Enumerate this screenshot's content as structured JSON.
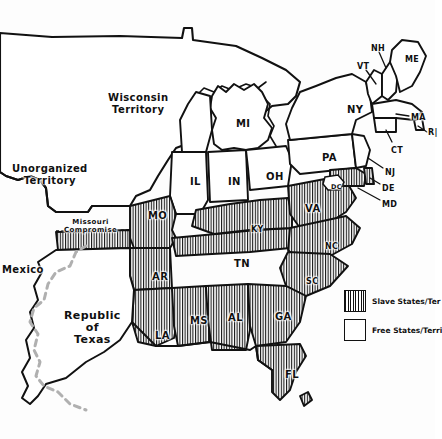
{
  "map": {
    "title": "United States c.1840 - Slave and Free States Map",
    "style": "hand-drawn ink sketch",
    "background_color": "#fdfdfd",
    "ink_color": "#111111",
    "hatch_color": "#111111",
    "mexico_border_color": "#b0b0b0"
  },
  "territories": [
    {
      "name": "wisconsin-territory",
      "line1": "Wisconsin",
      "line2": "Territory",
      "x": 108,
      "y": 92,
      "status": "free"
    },
    {
      "name": "unorganized-territory",
      "line1": "Unorganized",
      "line2": "Territory",
      "x": 12,
      "y": 163,
      "status": "free"
    },
    {
      "name": "mexico",
      "line1": "Mexico",
      "line2": "",
      "x": 2,
      "y": 264,
      "status": "foreign"
    },
    {
      "name": "republic-of-texas",
      "line1": "Republic",
      "line2": "of",
      "line3": "Texas",
      "x": 64,
      "y": 310,
      "status": "foreign"
    }
  ],
  "annotations": {
    "missouri_compromise": {
      "line1": "Missouri",
      "line2": "Compromise",
      "x": 64,
      "y": 219
    }
  },
  "states": [
    {
      "abbr": "MI",
      "x": 236,
      "y": 118,
      "status": "free",
      "size": "st"
    },
    {
      "abbr": "IL",
      "x": 190,
      "y": 176,
      "status": "free",
      "size": "st"
    },
    {
      "abbr": "IN",
      "x": 228,
      "y": 176,
      "status": "free",
      "size": "st"
    },
    {
      "abbr": "OH",
      "x": 266,
      "y": 171,
      "status": "free",
      "size": "st"
    },
    {
      "abbr": "PA",
      "x": 322,
      "y": 152,
      "status": "free",
      "size": "st"
    },
    {
      "abbr": "NY",
      "x": 347,
      "y": 104,
      "status": "free",
      "size": "st"
    },
    {
      "abbr": "VT",
      "x": 357,
      "y": 62,
      "status": "free",
      "size": "st-sm"
    },
    {
      "abbr": "NH",
      "x": 371,
      "y": 44,
      "status": "free",
      "size": "st-sm"
    },
    {
      "abbr": "ME",
      "x": 405,
      "y": 55,
      "status": "free",
      "size": "st-sm"
    },
    {
      "abbr": "MA",
      "x": 411,
      "y": 113,
      "status": "free",
      "size": "st-sm"
    },
    {
      "abbr": "R|",
      "x": 428,
      "y": 128,
      "status": "free",
      "size": "st-sm"
    },
    {
      "abbr": "CT",
      "x": 391,
      "y": 146,
      "status": "free",
      "size": "st-sm"
    },
    {
      "abbr": "NJ",
      "x": 385,
      "y": 168,
      "status": "free",
      "size": "st-sm"
    },
    {
      "abbr": "DE",
      "x": 382,
      "y": 184,
      "status": "slave",
      "size": "st-sm"
    },
    {
      "abbr": "MD",
      "x": 382,
      "y": 200,
      "status": "slave",
      "size": "st-sm"
    },
    {
      "abbr": "VA",
      "x": 305,
      "y": 203,
      "status": "slave",
      "size": "st"
    },
    {
      "abbr": "DC",
      "x": 331,
      "y": 183,
      "status": "slave",
      "size": "st-xs"
    },
    {
      "abbr": "NC",
      "x": 325,
      "y": 242,
      "status": "slave",
      "size": "st-sm"
    },
    {
      "abbr": "SC",
      "x": 306,
      "y": 277,
      "status": "slave",
      "size": "st-sm"
    },
    {
      "abbr": "GA",
      "x": 275,
      "y": 311,
      "status": "slave",
      "size": "st"
    },
    {
      "abbr": "FL",
      "x": 285,
      "y": 369,
      "status": "slave",
      "size": "st"
    },
    {
      "abbr": "AL",
      "x": 228,
      "y": 312,
      "status": "slave",
      "size": "st"
    },
    {
      "abbr": "MS",
      "x": 190,
      "y": 315,
      "status": "slave",
      "size": "st"
    },
    {
      "abbr": "LA",
      "x": 155,
      "y": 330,
      "status": "slave",
      "size": "st"
    },
    {
      "abbr": "AR",
      "x": 152,
      "y": 271,
      "status": "slave",
      "size": "st"
    },
    {
      "abbr": "MO",
      "x": 148,
      "y": 210,
      "status": "slave",
      "size": "st"
    },
    {
      "abbr": "TN",
      "x": 234,
      "y": 258,
      "status": "slave",
      "size": "st"
    },
    {
      "abbr": "KY",
      "x": 251,
      "y": 225,
      "status": "slave",
      "size": "st-sm"
    }
  ],
  "legend": {
    "items": [
      {
        "swatch": "hatched",
        "label": "Slave States/Ter"
      },
      {
        "swatch": "blank",
        "label": "Free States/Terri"
      }
    ]
  },
  "caption": {
    "text": ""
  }
}
